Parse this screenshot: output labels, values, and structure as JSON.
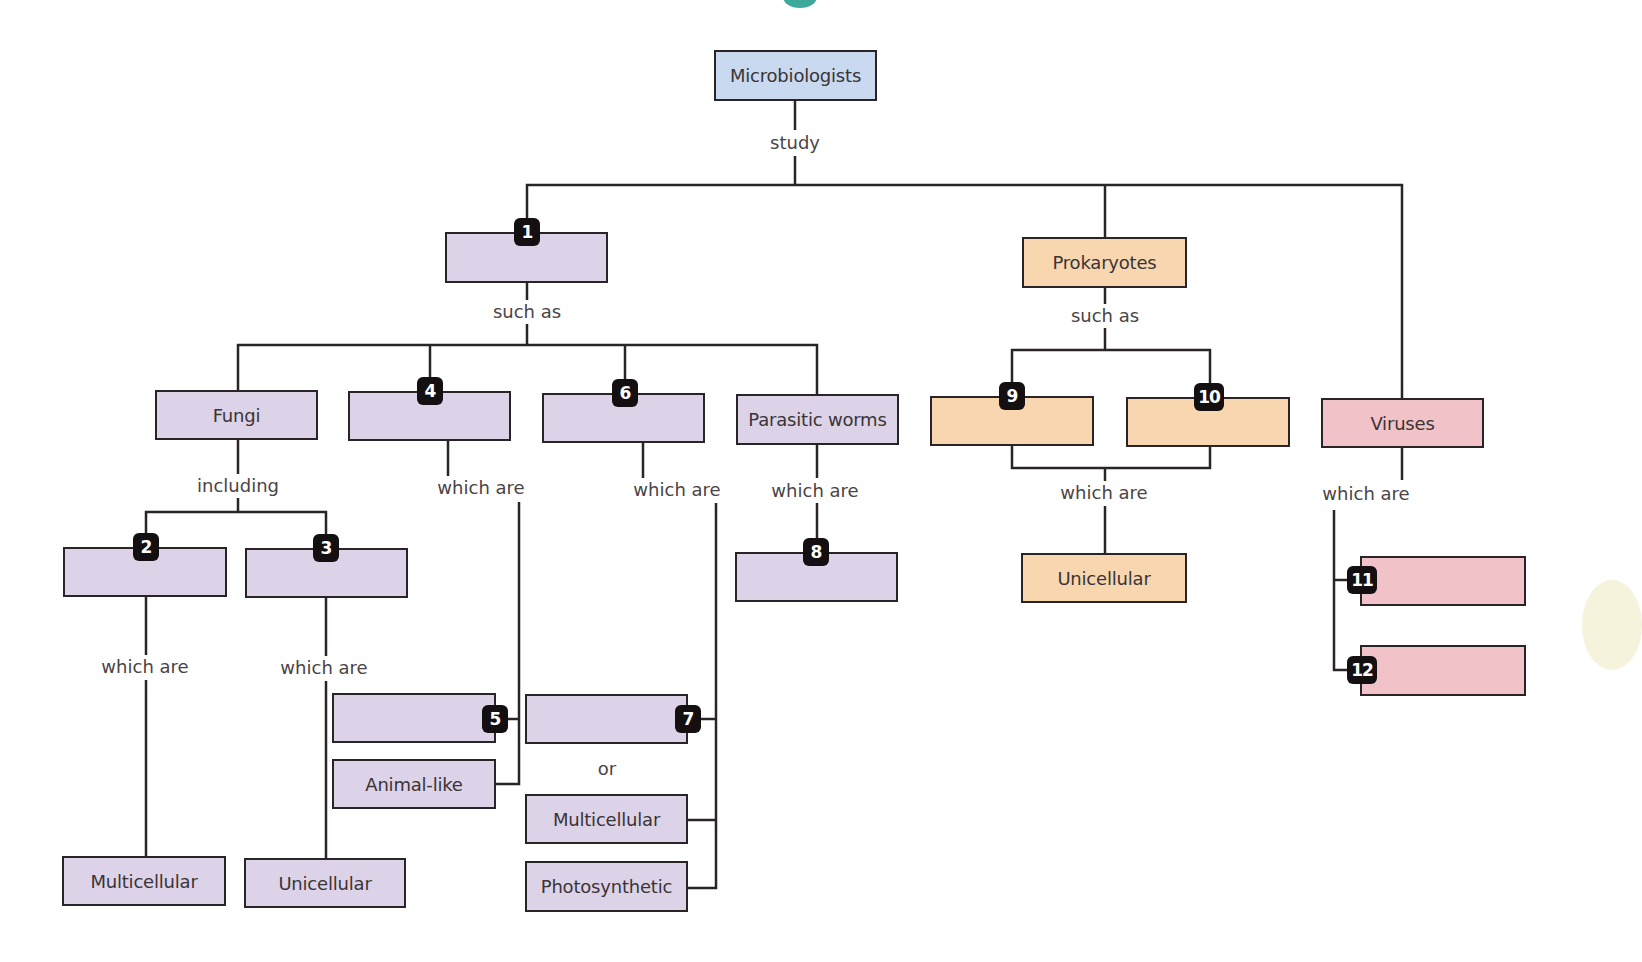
{
  "title_fragment_color": "#1a9a8a",
  "colors": {
    "root": "#c9d9f0",
    "eukaryote_group": "#dcd3e8",
    "prokaryote_group": "#f8d7b0",
    "virus_group": "#f1c2c8",
    "badge": "#141012",
    "line": "#2a2426"
  },
  "nodes": {
    "root": "Microbiologists",
    "blank1": "",
    "prokaryotes": "Prokaryotes",
    "viruses": "Viruses",
    "fungi": "Fungi",
    "blank4": "",
    "blank6": "",
    "parasitic_worms": "Parasitic worms",
    "blank9": "",
    "blank10": "",
    "blank2": "",
    "blank3": "",
    "blank8": "",
    "prok_unicellular": "Unicellular",
    "blank11": "",
    "blank12": "",
    "blank5": "",
    "animal_like": "Animal-like",
    "blank7": "",
    "multicellular_7": "Multicellular",
    "photosynthetic": "Photosynthetic",
    "fungi_multicellular": "Multicellular",
    "fungi_unicellular": "Unicellular"
  },
  "labels": {
    "study": "study",
    "such_as_1": "such as",
    "such_as_prok": "such as",
    "including": "including",
    "which_are_4": "which are",
    "which_are_6": "which are",
    "which_are_worms": "which are",
    "which_are_prok": "which are",
    "which_are_viruses": "which are",
    "which_are_2": "which are",
    "which_are_3": "which are",
    "or": "or"
  },
  "badges": {
    "b1": "1",
    "b2": "2",
    "b3": "3",
    "b4": "4",
    "b5": "5",
    "b6": "6",
    "b7": "7",
    "b8": "8",
    "b9": "9",
    "b10": "10",
    "b11": "11",
    "b12": "12"
  }
}
